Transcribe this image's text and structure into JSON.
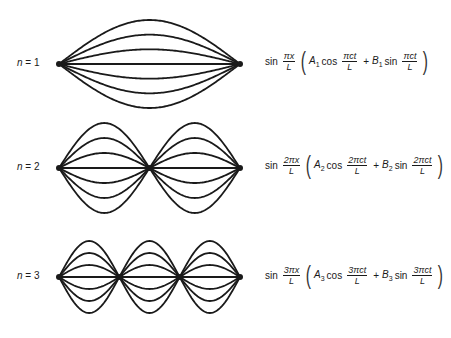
{
  "figure": {
    "type": "standing-wave-modes",
    "stroke_color": "#1a1a1a",
    "modes": [
      {
        "n": 1,
        "label_prefix": "n",
        "label_value": "= 1",
        "formula": {
          "sin_word": "sin",
          "x_num": "πx",
          "x_den": "L",
          "A": "A",
          "A_sub": "1",
          "cos_word": "cos",
          "t_num_cos": "πct",
          "t_den_cos": "L",
          "plus": "+",
          "B": "B",
          "B_sub": "1",
          "sin2_word": "sin",
          "t_num_sin": "πct",
          "t_den_sin": "L",
          "lparen": "(",
          "rparen": ")"
        }
      },
      {
        "n": 2,
        "label_prefix": "n",
        "label_value": "= 2",
        "formula": {
          "sin_word": "sin",
          "x_num": "2πx",
          "x_den": "L",
          "A": "A",
          "A_sub": "2",
          "cos_word": "cos",
          "t_num_cos": "2πct",
          "t_den_cos": "L",
          "plus": "+",
          "B": "B",
          "B_sub": "2",
          "sin2_word": "sin",
          "t_num_sin": "2πct",
          "t_den_sin": "L",
          "lparen": "(",
          "rparen": ")"
        }
      },
      {
        "n": 3,
        "label_prefix": "n",
        "label_value": "= 3",
        "formula": {
          "sin_word": "sin",
          "x_num": "3πx",
          "x_den": "L",
          "A": "A",
          "A_sub": "3",
          "cos_word": "cos",
          "t_num_cos": "3πct",
          "t_den_cos": "L",
          "plus": "+",
          "B": "B",
          "B_sub": "3",
          "sin2_word": "sin",
          "t_num_sin": "3πct",
          "t_den_sin": "L",
          "lparen": "(",
          "rparen": ")"
        }
      }
    ]
  }
}
